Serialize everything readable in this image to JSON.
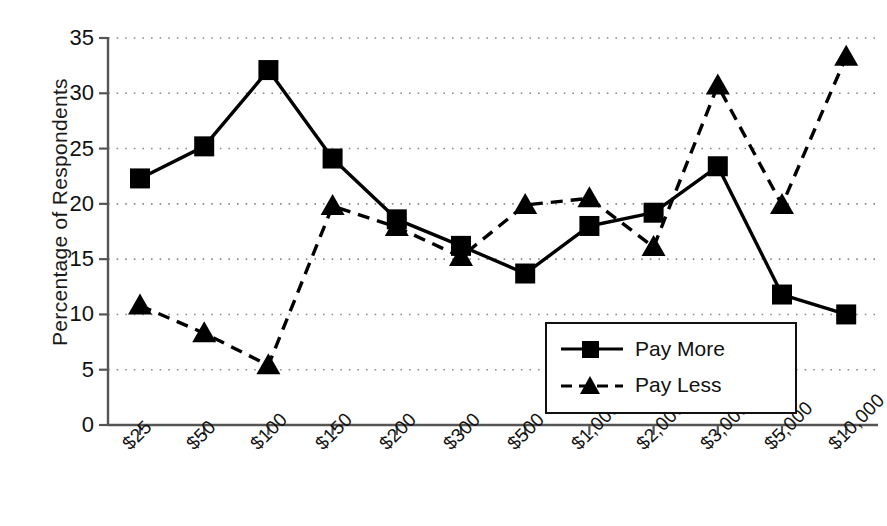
{
  "chart_data": {
    "type": "line",
    "title": "",
    "xlabel": "",
    "ylabel": "Percentage of  Respondents",
    "ylim": [
      0,
      35
    ],
    "ytick_values": [
      0,
      5,
      10,
      15,
      20,
      25,
      30,
      35
    ],
    "ytick_labels": [
      "0",
      "5",
      "10",
      "15",
      "20",
      "25",
      "30",
      "35"
    ],
    "grid": "horizontal-dotted",
    "legend_position": "inside-lower-right",
    "categories": [
      "$25",
      "$50",
      "$100",
      "$150",
      "$200",
      "$300",
      "$500",
      "$1,000",
      "$2,000",
      "$3,000",
      "$5,000",
      "$10,000"
    ],
    "series": [
      {
        "name": "Pay More",
        "marker": "square",
        "line_style": "solid",
        "color": "#000000",
        "values": [
          22.3,
          25.2,
          32.1,
          24.1,
          18.6,
          16.2,
          13.7,
          18.0,
          19.2,
          23.4,
          11.8,
          10.0
        ]
      },
      {
        "name": "Pay Less",
        "marker": "triangle",
        "line_style": "dashed",
        "color": "#000000",
        "values": [
          10.8,
          8.3,
          5.4,
          19.8,
          17.9,
          15.2,
          19.9,
          20.5,
          16.1,
          30.7,
          19.9,
          33.3
        ]
      }
    ]
  },
  "legend": {
    "items": [
      {
        "label": "Pay More"
      },
      {
        "label": "Pay Less"
      }
    ]
  }
}
